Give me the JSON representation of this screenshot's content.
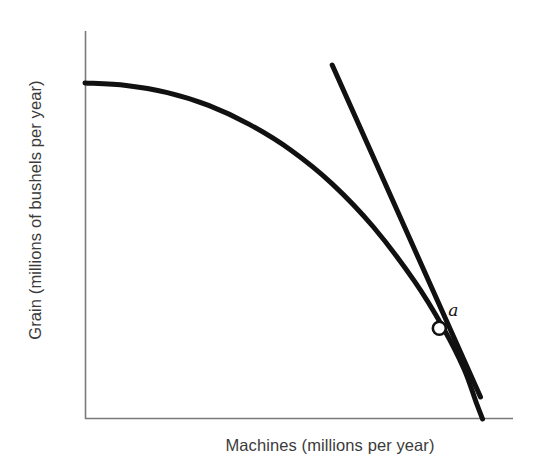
{
  "chart_data": {
    "type": "line",
    "title": "",
    "xlabel": "Machines (millions per year)",
    "ylabel": "Grain (millions of bushels per year)",
    "xlim": [
      0,
      100
    ],
    "ylim": [
      0,
      100
    ],
    "grid": false,
    "legend": null,
    "series": [
      {
        "name": "production possibilities frontier",
        "type": "curve",
        "stroke": "#111111",
        "stroke_width": 5,
        "points": [
          {
            "x": 0,
            "y": 84
          },
          {
            "x": 10,
            "y": 83.4
          },
          {
            "x": 20,
            "y": 81.6
          },
          {
            "x": 30,
            "y": 78.4
          },
          {
            "x": 40,
            "y": 73.6
          },
          {
            "x": 50,
            "y": 67.2
          },
          {
            "x": 60,
            "y": 58.8
          },
          {
            "x": 70,
            "y": 48.0
          },
          {
            "x": 80,
            "y": 34.4
          },
          {
            "x": 87,
            "y": 22.7
          },
          {
            "x": 92,
            "y": 12.5
          },
          {
            "x": 95,
            "y": 4.0
          },
          {
            "x": 96.5,
            "y": 0
          }
        ]
      },
      {
        "name": "tangent line at a",
        "type": "straight-line",
        "stroke": "#111111",
        "stroke_width": 5,
        "points": [
          {
            "x": 60,
            "y": 88.5
          },
          {
            "x": 96,
            "y": 5.5
          }
        ]
      }
    ],
    "annotations": [
      {
        "label": "a",
        "marker": "open-circle",
        "marker_fill": "#ffffff",
        "marker_stroke": "#111111",
        "x": 86,
        "y": 22.7,
        "label_offset": {
          "x": 9,
          "y": 15
        }
      }
    ],
    "axes": {
      "stroke": "#7a7a7a",
      "stroke_width": 1.6,
      "show_ticks": false,
      "show_tick_labels": false
    },
    "colors": {
      "background": "#ffffff",
      "curve": "#111111",
      "tangent": "#111111",
      "axis": "#7a7a7a",
      "text": "#3b3b3b"
    }
  }
}
